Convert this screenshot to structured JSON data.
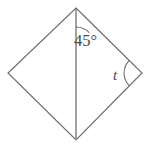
{
  "figure": {
    "type": "geometry-diagram",
    "shape_name": "rhombus",
    "background_color": "#ffffff",
    "edge_color": "#6b6b6b",
    "diagonal_color": "#8a8a8a",
    "label_color": "#4a4a4a",
    "vertices": {
      "top": {
        "x": 76,
        "y": 8
      },
      "right": {
        "x": 142,
        "y": 73
      },
      "bottom": {
        "x": 76,
        "y": 140
      },
      "left": {
        "x": 8,
        "y": 73
      }
    },
    "outline_path": "M 76 8 L 142 73 L 76 140 L 8 73 Z",
    "diagonal_path": "M 76 9 L 76 140",
    "angles": [
      {
        "id": "top-angle",
        "label": "45°",
        "value": 45,
        "unit": "degrees",
        "vertex": "top",
        "between": [
          "vertical-diagonal",
          "upper-right-edge"
        ],
        "label_x": 74,
        "label_y": 46,
        "arc_path": "M 76 27 A 19 19 0 0 1 89.3 32.6"
      },
      {
        "id": "right-angle",
        "label": "t",
        "value": null,
        "unit": "variable",
        "vertex": "right",
        "between": [
          "upper-right-edge",
          "lower-right-edge"
        ],
        "label_x": 113,
        "label_y": 80,
        "arc_path": "M 129.3 60.3 A 18 18 0 0 0 129.3 85.7"
      }
    ]
  }
}
